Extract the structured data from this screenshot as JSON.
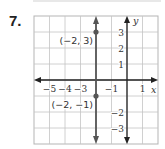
{
  "problem": {
    "number": "7."
  },
  "chart_data": {
    "type": "line",
    "title": "",
    "xlabel": "x",
    "ylabel": "y",
    "xlim": [
      -6,
      2
    ],
    "ylim": [
      -4,
      4
    ],
    "grid": true,
    "x_tick_labels": [
      "−5",
      "−4",
      "−3",
      "−1",
      "1"
    ],
    "y_tick_labels": [
      "3",
      "2",
      "1",
      "−2",
      "−3"
    ],
    "series": [
      {
        "name": "vertical line x = −2",
        "equation": "x = -2",
        "points": [
          [
            -2,
            3
          ],
          [
            -2,
            -1
          ]
        ]
      }
    ],
    "annotations": [
      {
        "label": "(−2, 3)",
        "x": -2,
        "y": 3
      },
      {
        "label": "(−2, −1)",
        "x": -2,
        "y": -1
      }
    ]
  }
}
